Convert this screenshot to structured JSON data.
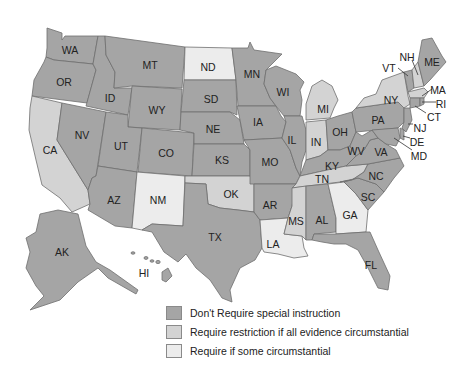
{
  "colors": {
    "dark": "#a5a5a5",
    "medium": "#d3d3d3",
    "light": "#ececec",
    "border": "#6e6e6e"
  },
  "legend": [
    {
      "category": "dark",
      "label": "Don't Require special instruction"
    },
    {
      "category": "medium",
      "label": "Require restriction if all evidence circumstantial"
    },
    {
      "category": "light",
      "label": "Require if some circumstantial"
    }
  ],
  "states": {
    "WA": "dark",
    "OR": "dark",
    "CA": "medium",
    "NV": "dark",
    "ID": "dark",
    "MT": "dark",
    "WY": "dark",
    "UT": "dark",
    "AZ": "dark",
    "CO": "dark",
    "NM": "light",
    "ND": "light",
    "SD": "dark",
    "NE": "dark",
    "KS": "dark",
    "OK": "medium",
    "TX": "dark",
    "MN": "dark",
    "IA": "dark",
    "MO": "dark",
    "AR": "dark",
    "LA": "light",
    "WI": "dark",
    "IL": "dark",
    "MI": "medium",
    "IN": "medium",
    "OH": "dark",
    "KY": "dark",
    "TN": "medium",
    "MS": "medium",
    "AL": "dark",
    "GA": "light",
    "FL": "dark",
    "SC": "dark",
    "NC": "dark",
    "VA": "dark",
    "WV": "dark",
    "PA": "dark",
    "NY": "medium",
    "VT": "dark",
    "NH": "medium",
    "ME": "dark",
    "MA": "medium",
    "RI": "dark",
    "CT": "dark",
    "NJ": "dark",
    "DE": "dark",
    "MD": "dark",
    "AK": "dark",
    "HI": "dark"
  },
  "labels": {
    "WA": "WA",
    "OR": "OR",
    "CA": "CA",
    "NV": "NV",
    "ID": "ID",
    "MT": "MT",
    "WY": "WY",
    "UT": "UT",
    "AZ": "AZ",
    "CO": "CO",
    "NM": "NM",
    "ND": "ND",
    "SD": "SD",
    "NE": "NE",
    "KS": "KS",
    "OK": "OK",
    "TX": "TX",
    "MN": "MN",
    "IA": "IA",
    "MO": "MO",
    "AR": "AR",
    "LA": "LA",
    "WI": "WI",
    "IL": "IL",
    "MI": "MI",
    "IN": "IN",
    "OH": "OH",
    "KY": "KY",
    "TN": "TN",
    "MS": "MS",
    "AL": "AL",
    "GA": "GA",
    "FL": "FL",
    "SC": "SC",
    "NC": "NC",
    "VA": "VA",
    "WV": "WV",
    "PA": "PA",
    "NY": "NY",
    "VT": "VT",
    "NH": "NH",
    "ME": "ME",
    "MA": "MA",
    "RI": "RI",
    "CT": "CT",
    "NJ": "NJ",
    "DE": "DE",
    "MD": "MD",
    "AK": "AK",
    "HI": "HI"
  }
}
